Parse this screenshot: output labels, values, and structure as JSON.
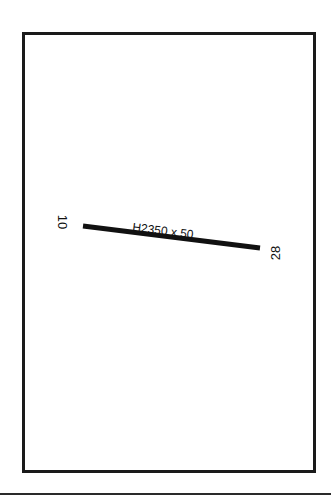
{
  "diagram": {
    "type": "airport-runway-diagram",
    "runway": {
      "end_a": "10",
      "end_b": "28",
      "dimensions": "H2350 x 50",
      "color": "#111111"
    },
    "colors": {
      "frame": "#1a1a1a",
      "background": "#ffffff"
    }
  }
}
